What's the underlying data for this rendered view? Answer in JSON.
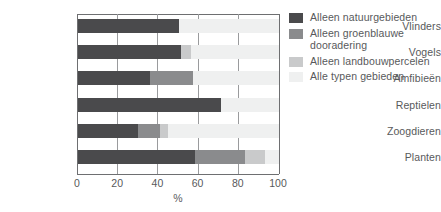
{
  "chart_data": {
    "type": "bar",
    "orientation": "horizontal",
    "stacked": true,
    "title": "",
    "xlabel": "%",
    "ylabel": "",
    "xlim": [
      0,
      100
    ],
    "xticks": [
      0,
      20,
      40,
      60,
      80,
      100
    ],
    "xtick_labels": [
      "0",
      "20",
      "40",
      "60",
      "80",
      "100"
    ],
    "grid": true,
    "legend_position": "right",
    "categories": [
      "Vlinders",
      "Vogels",
      "Amfibieën",
      "Reptielen",
      "Zoogdieren",
      "Planten"
    ],
    "series": [
      {
        "name": "Alleen natuurgebieden",
        "color": "#4a4a4c",
        "values": [
          50,
          51,
          36,
          71,
          30,
          58
        ]
      },
      {
        "name": "Alleen groenblauwe dooradering",
        "color": "#8a8b8d",
        "values": [
          0,
          0,
          21,
          0,
          11,
          25
        ]
      },
      {
        "name": "Alleen landbouwpercelen",
        "color": "#c9cacb",
        "values": [
          0,
          5,
          0,
          0,
          4,
          10
        ]
      },
      {
        "name": "Alle typen gebieden",
        "color": "#eff0f0",
        "values": [
          50,
          44,
          43,
          29,
          55,
          7
        ]
      }
    ]
  },
  "legend": {
    "items": [
      {
        "label": "Alleen natuurgebieden",
        "color": "#4a4a4c"
      },
      {
        "label": "Alleen groenblauwe dooradering",
        "color": "#8a8b8d"
      },
      {
        "label": "Alleen landbouwpercelen",
        "color": "#c9cacb"
      },
      {
        "label": "Alle typen gebieden",
        "color": "#eff0f0"
      }
    ]
  },
  "axis": {
    "x_title": "%"
  }
}
